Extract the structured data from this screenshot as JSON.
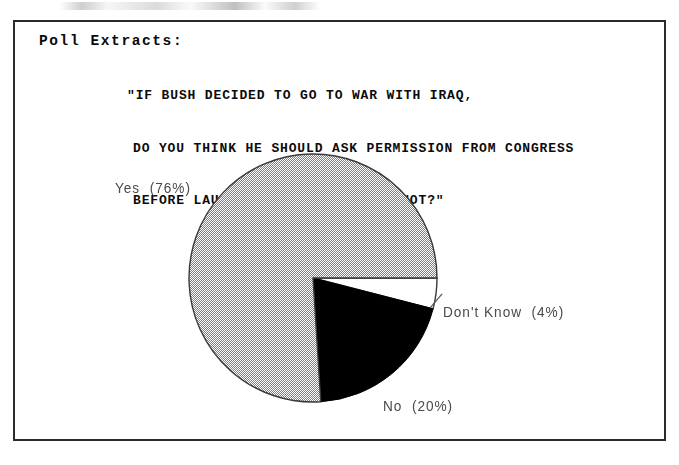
{
  "document": {
    "section_heading": "Poll Extracts:",
    "question_lines": [
      "\"IF BUSH DECIDED TO GO TO WAR WITH IRAQ,",
      "DO YOU THINK HE SHOULD ASK PERMISSION FROM CONGRESS",
      "BEFORE LAUNCHING AN ATTACK, OR NOT?\""
    ]
  },
  "labels": {
    "yes": "Yes  (76%)",
    "dont_know": "Don't Know  (4%)",
    "no": "No  (20%)"
  },
  "colors": {
    "frame": "#2b2b2b",
    "text": "#0b0b0b",
    "label_text": "#4a4a4a",
    "slice_yes": "#b4b4b4",
    "slice_no": "#000000",
    "slice_dont_know": "#ffffff",
    "outline": "#3a3a3a"
  },
  "chart_data": {
    "type": "pie",
    "title": "\"IF BUSH DECIDED TO GO TO WAR WITH IRAQ, DO YOU THINK HE SHOULD ASK PERMISSION FROM CONGRESS BEFORE LAUNCHING AN ATTACK, OR NOT?\"",
    "xlabel": "",
    "ylabel": "",
    "legend_position": "none",
    "grid": false,
    "labels_on_slices": true,
    "categories": [
      "Yes",
      "No",
      "Don't Know"
    ],
    "values": [
      76,
      20,
      4
    ],
    "unit": "percent",
    "slices": [
      {
        "label": "Yes",
        "value": 76,
        "display": "Yes  (76%)",
        "fill": "gray-hatch",
        "start_angle_deg": 86.4,
        "end_angle_deg": 360.0
      },
      {
        "label": "No",
        "value": 20,
        "display": "No  (20%)",
        "fill": "black",
        "start_angle_deg": 14.4,
        "end_angle_deg": 86.4
      },
      {
        "label": "Don't Know",
        "value": 4,
        "display": "Don't Know  (4%)",
        "fill": "white",
        "start_angle_deg": 0.0,
        "end_angle_deg": 14.4
      }
    ],
    "geometry": {
      "center_x": 311,
      "center_y": 276,
      "radius": 124,
      "start_at_deg": 0,
      "direction": "clockwise"
    }
  }
}
